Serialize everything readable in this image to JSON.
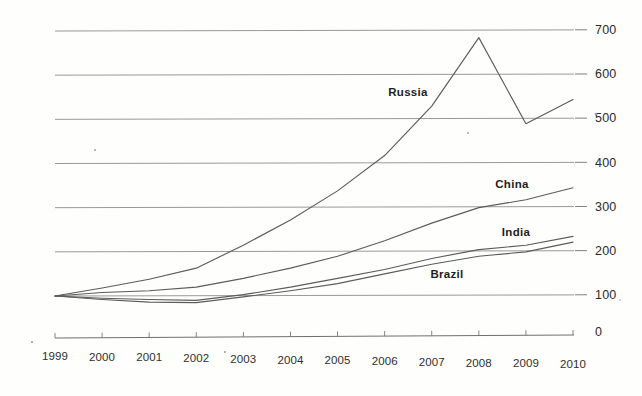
{
  "chart_data": {
    "type": "line",
    "title": "",
    "xlabel": "",
    "ylabel": "",
    "x": [
      1999,
      2000,
      2001,
      2002,
      2003,
      2004,
      2005,
      2006,
      2007,
      2008,
      2009,
      2010
    ],
    "categories": [
      "1999",
      "2000",
      "2001",
      "2002",
      "2003",
      "2004",
      "2005",
      "2006",
      "2007",
      "2008",
      "2009",
      "2010"
    ],
    "xlim": [
      1999,
      2010
    ],
    "ylim": [
      0,
      800
    ],
    "y_ticks": [
      100,
      200,
      300,
      400,
      500,
      600,
      700
    ],
    "y_tick_labels": [
      "100",
      "200",
      "300",
      "400",
      "500",
      "600",
      "700"
    ],
    "axis_origin_label": "0",
    "y_axis_position": "right",
    "x_axis_position": "bottom",
    "grid": true,
    "grid_axis": "y",
    "legend": "inline-labels",
    "line_color": "#5c5c5c",
    "background_color": "#fefefc",
    "grid_color": "#8d8d8d",
    "series": [
      {
        "name": "Russia",
        "label": "Russia",
        "values": [
          100,
          118,
          138,
          163,
          215,
          272,
          338,
          418,
          530,
          685,
          490,
          545
        ]
      },
      {
        "name": "China",
        "label": "China",
        "values": [
          100,
          108,
          112,
          120,
          140,
          163,
          190,
          225,
          265,
          300,
          318,
          345
        ]
      },
      {
        "name": "India",
        "label": "India",
        "values": [
          100,
          95,
          92,
          90,
          103,
          120,
          140,
          160,
          185,
          205,
          215,
          235
        ]
      },
      {
        "name": "Brazil",
        "label": "Brazil",
        "values": [
          100,
          92,
          86,
          85,
          98,
          112,
          128,
          150,
          172,
          190,
          200,
          222
        ]
      }
    ],
    "series_label_positions": [
      {
        "name": "Russia",
        "x": 408,
        "y": 96
      },
      {
        "name": "China",
        "x": 512,
        "y": 188
      },
      {
        "name": "India",
        "x": 516,
        "y": 236
      },
      {
        "name": "Brazil",
        "x": 447,
        "y": 278
      }
    ]
  }
}
